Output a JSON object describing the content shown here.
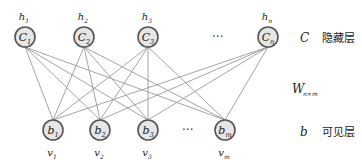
{
  "diagram": {
    "hidden_layer": {
      "symbol": "C",
      "label": "隐藏层",
      "nodes": [
        {
          "id": "c1",
          "name": "C",
          "sub": "1",
          "top": "h",
          "top_sub": "1",
          "x": 25,
          "y": 37
        },
        {
          "id": "c2",
          "name": "C",
          "sub": "2",
          "top": "h",
          "top_sub": "2",
          "x": 84,
          "y": 37
        },
        {
          "id": "c3",
          "name": "C",
          "sub": "3",
          "top": "h",
          "top_sub": "3",
          "x": 148,
          "y": 37
        },
        {
          "id": "cn",
          "name": "C",
          "sub": "n",
          "top": "h",
          "top_sub": "n",
          "x": 268,
          "y": 37
        }
      ],
      "ellipsis": "···"
    },
    "weights": {
      "symbol": "W",
      "sub": "n×m"
    },
    "visible_layer": {
      "symbol": "b",
      "label": "可见层",
      "nodes": [
        {
          "id": "b1",
          "name": "b",
          "sub": "1",
          "bottom": "v",
          "bottom_sub": "1",
          "x": 53,
          "y": 130
        },
        {
          "id": "b2",
          "name": "b",
          "sub": "2",
          "bottom": "v",
          "bottom_sub": "2",
          "x": 100,
          "y": 130
        },
        {
          "id": "b3",
          "name": "b",
          "sub": "3",
          "bottom": "v",
          "bottom_sub": "3",
          "x": 148,
          "y": 130
        },
        {
          "id": "bm",
          "name": "b",
          "sub": "m",
          "bottom": "v",
          "bottom_sub": "m",
          "x": 225,
          "y": 130
        }
      ],
      "ellipsis": "···"
    },
    "colors": {
      "node_fill": "#e6e6e6",
      "node_stroke": "#555555",
      "edge": "#9a9a9a"
    }
  }
}
